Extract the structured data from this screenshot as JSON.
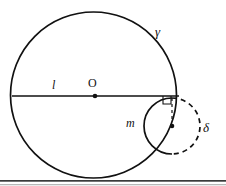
{
  "figure": {
    "caption": "",
    "background_color": "#ffffff",
    "stroke_color": "#111111",
    "rule_color": "#3a3a3a",
    "rule_color_light": "#b8b8b8",
    "labels": {
      "gamma": "γ",
      "delta": "δ",
      "line_l": "l",
      "center_O": "O",
      "arc_m": "m"
    },
    "geometry": {
      "big_circle": {
        "cx": 93.5,
        "cy": 95,
        "r": 83,
        "style": "solid",
        "name": "gamma"
      },
      "small_circle": {
        "cx": 172,
        "cy": 126,
        "r": 28,
        "style": "left-solid-right-dashed",
        "name": "delta"
      },
      "chord_line": {
        "x1": 12,
        "y1": 96,
        "x2": 179,
        "y2": 96,
        "name": "l"
      },
      "center_dot_big": {
        "cx": 95,
        "cy": 96,
        "r": 2.2
      },
      "center_dot_small": {
        "cx": 172,
        "cy": 126,
        "r": 2.2
      },
      "radius_tick": {
        "x1": 172,
        "y1": 97,
        "x2": 172,
        "y2": 122,
        "style": "dashed"
      },
      "right_angle_mark": {
        "x": 163,
        "y": 96,
        "size": 8
      },
      "page_rule": {
        "y": 180,
        "height": 1.6
      },
      "page_rule_light": {
        "y": 184,
        "height": 1.2
      }
    }
  }
}
